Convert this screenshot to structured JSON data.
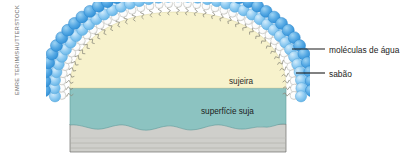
{
  "credit": {
    "text": "EMRE TERIM/SHUTTERSTOCK"
  },
  "diagram": {
    "regions": {
      "dirt_label": "sujeira",
      "surface_label": "superfície suja"
    },
    "callouts": [
      {
        "name": "water-molecules",
        "label": "moléculas de água"
      },
      {
        "name": "soap",
        "label": "sabão"
      }
    ],
    "colors": {
      "dirt_fill": "#f7f2cc",
      "dirty_surface_fill": "#8cc3c1",
      "substrate_fill": "#cfcfcb",
      "water_outer": "#3d9ee0",
      "water_inner": "#7ec4ee",
      "soap_head": "#ffffff",
      "soap_tail": "#8d8b7e",
      "leader_line": "#1b1b1b",
      "outline": "#5b5b58"
    }
  }
}
